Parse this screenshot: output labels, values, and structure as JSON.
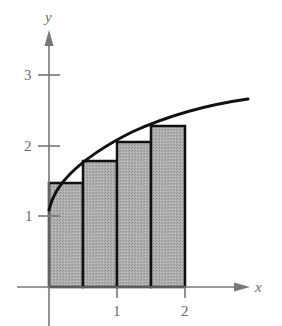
{
  "diagram": {
    "type": "riemann-sum",
    "axes": {
      "x_label": "x",
      "y_label": "y",
      "x_ticks": [
        "1",
        "2"
      ],
      "y_ticks": [
        "1",
        "2",
        "3"
      ]
    },
    "curve": {
      "approx_function": "y = 1 + sqrt(x)",
      "x_range": [
        0,
        2.9
      ]
    },
    "rectangles": [
      {
        "x0": 0,
        "x1": 0.5,
        "height": 1.5
      },
      {
        "x0": 0.5,
        "x1": 1,
        "height": 1.8
      },
      {
        "x0": 1,
        "x1": 1.5,
        "height": 2.05
      },
      {
        "x0": 1.5,
        "x1": 2,
        "height": 2.28
      }
    ],
    "colors": {
      "rect_fill": "#a8a8a8",
      "axis": "#777777",
      "curve": "#111111",
      "rect_stroke": "#111111"
    }
  }
}
